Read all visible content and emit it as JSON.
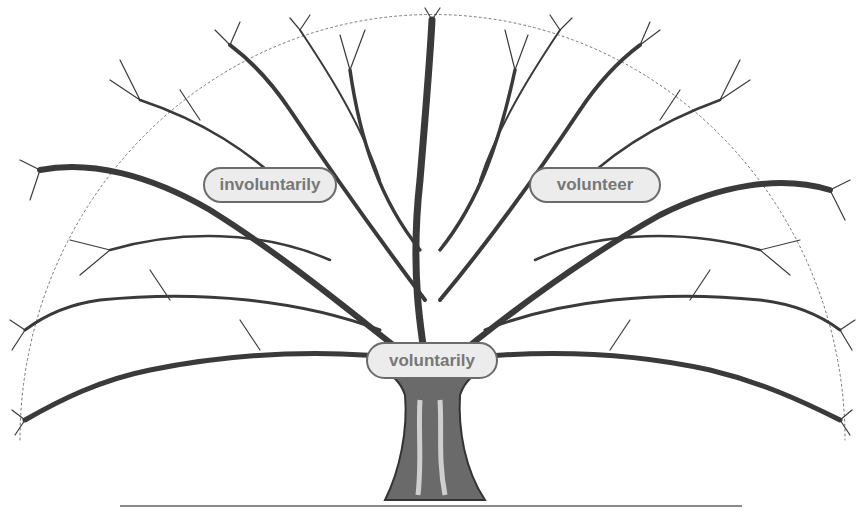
{
  "diagram": {
    "type": "word-family tree",
    "labels": {
      "root": "voluntarily",
      "left_branch": "involuntarily",
      "right_branch": "volunteer"
    },
    "colors": {
      "ink": "#3a3a3a",
      "label_fill": "#ececec",
      "label_border": "#6b6b6b",
      "label_text": "#777777",
      "ground_line": "#8a8a8a"
    }
  }
}
